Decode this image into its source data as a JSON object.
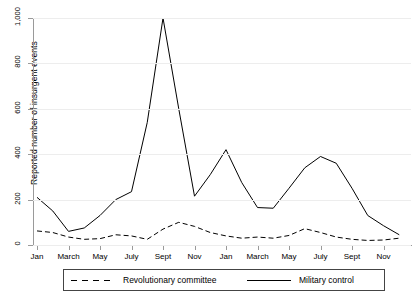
{
  "chart_data": {
    "type": "line",
    "title": "",
    "xlabel": "",
    "ylabel": "Reported number of insurgent events",
    "ylim": [
      0,
      1000
    ],
    "yticks": [
      0,
      200,
      400,
      600,
      800,
      1000
    ],
    "ytick_labels": [
      "0",
      "200",
      "400",
      "600",
      "800",
      "1,000"
    ],
    "grid": true,
    "legend_position": "below",
    "x": [
      1,
      2,
      3,
      4,
      5,
      6,
      7,
      8,
      9,
      10,
      11,
      12,
      13,
      14,
      15,
      16,
      17,
      18,
      19,
      20,
      21,
      22,
      23,
      24
    ],
    "categories": [
      "Jan",
      "Feb",
      "March",
      "April",
      "May",
      "June",
      "July",
      "Aug",
      "Sept",
      "Oct",
      "Nov",
      "Dec",
      "Jan",
      "Feb",
      "March",
      "April",
      "May",
      "June",
      "July",
      "Aug",
      "Sept",
      "Oct",
      "Nov",
      "Dec"
    ],
    "xtick_labels": [
      "Jan",
      "March",
      "May",
      "July",
      "Sept",
      "Nov",
      "Jan",
      "March",
      "May",
      "July",
      "Sept",
      "Nov"
    ],
    "xtick_positions": [
      1,
      3,
      5,
      7,
      9,
      11,
      13,
      15,
      17,
      19,
      21,
      23
    ],
    "series": [
      {
        "name": "Revolutionary committee",
        "style": "dashed",
        "color": "#000000",
        "values": [
          62,
          55,
          35,
          25,
          28,
          45,
          40,
          25,
          70,
          100,
          82,
          55,
          40,
          30,
          35,
          30,
          42,
          72,
          55,
          35,
          25,
          20,
          22,
          30
        ]
      },
      {
        "name": "Military control",
        "style": "solid",
        "color": "#000000",
        "values": [
          210,
          150,
          60,
          75,
          130,
          200,
          235,
          540,
          1000,
          600,
          215,
          310,
          420,
          275,
          165,
          162,
          250,
          340,
          390,
          360,
          250,
          130,
          85,
          45
        ]
      }
    ]
  },
  "legend": {
    "items": [
      {
        "label": "Revolutionary committee",
        "style": "dashed"
      },
      {
        "label": "Military control",
        "style": "solid"
      }
    ]
  }
}
